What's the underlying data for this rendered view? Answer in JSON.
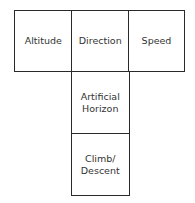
{
  "diagram": {
    "boxes": [
      {
        "id": "altitude",
        "label": "Altitude"
      },
      {
        "id": "direction",
        "label": "Direction"
      },
      {
        "id": "speed",
        "label": "Speed"
      },
      {
        "id": "artificial-horizon",
        "label": "Artificial\nHorizon"
      },
      {
        "id": "climb-descent",
        "label": "Climb/\nDescent"
      }
    ],
    "border_color": "#2a2a2a",
    "text_color": "#333333"
  }
}
